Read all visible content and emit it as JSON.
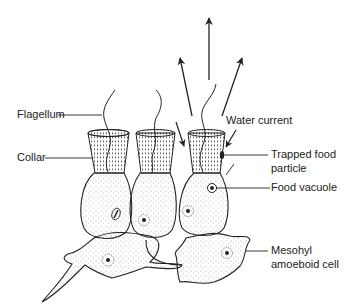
{
  "diagram": {
    "labels": {
      "flagellum": "Flagellum",
      "collar": "Collar",
      "water_current": "Water current",
      "trapped_food_line1": "Trapped food",
      "trapped_food_line2": "particle",
      "food_vacuole": "Food vacuole",
      "mesohyl_line1": "Mesohyl",
      "mesohyl_line2": "amoeboid cell"
    },
    "colors": {
      "ink": "#222222",
      "background": "#ffffff"
    }
  }
}
